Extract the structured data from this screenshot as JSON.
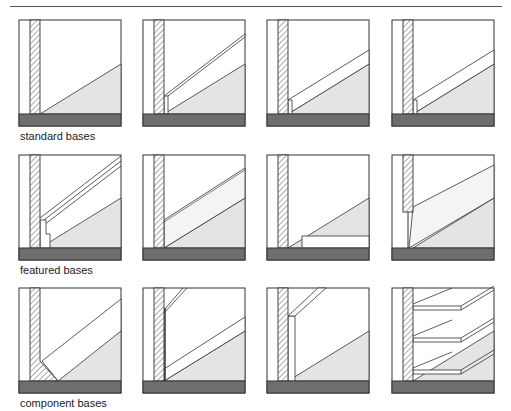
{
  "figure": {
    "captions": [
      {
        "label": "standard bases",
        "x": 20,
        "y": 130
      },
      {
        "label": "featured bases",
        "x": 20,
        "y": 264
      },
      {
        "label": "component bases",
        "x": 20,
        "y": 397
      }
    ]
  },
  "colors": {
    "floor": "#6e6e6e",
    "stair_fill": "#e4e4e4",
    "base_fill": "#f4f4f4",
    "line": "#333333"
  },
  "rows": [
    {
      "name": "standard bases",
      "top": 20,
      "bottom": 126
    },
    {
      "name": "featured bases",
      "top": 155,
      "bottom": 260
    },
    {
      "name": "component bases",
      "top": 288,
      "bottom": 393
    }
  ],
  "columns": [
    19,
    143,
    267,
    392
  ],
  "box_width": 102
}
